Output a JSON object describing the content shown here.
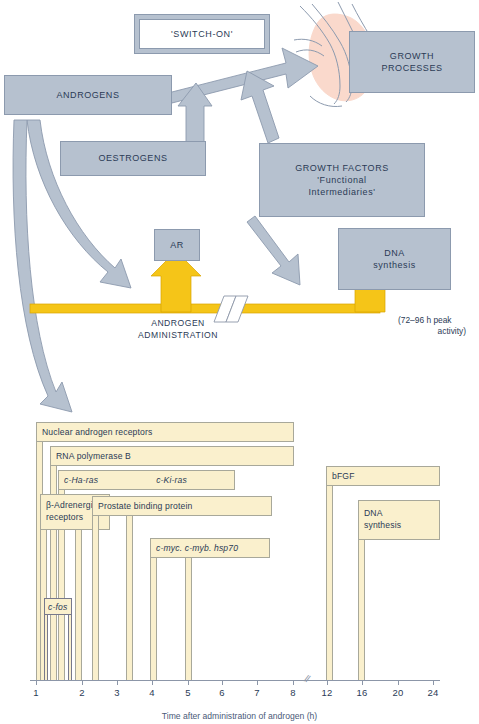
{
  "figure": {
    "flow": {
      "switch_on": "'SWITCH-ON'",
      "androgens": "ANDROGENS",
      "oestrogens": "OESTROGENS",
      "growth_processes": "GROWTH\nPROCESSES",
      "growth_processes_line1": "GROWTH",
      "growth_processes_line2": "PROCESSES",
      "growth_factors_line1": "GROWTH FACTORS",
      "growth_factors_line2": "'Functional",
      "growth_factors_line3": "Intermediaries'",
      "ar": "AR",
      "dna_line1": "DNA",
      "dna_line2": "synthesis",
      "androgen_administration_line1": "ANDROGEN",
      "androgen_administration_line2": "ADMINISTRATION",
      "peak_note_line1": "(72–96 h peak",
      "peak_note_line2": "activity)"
    },
    "colors": {
      "box_fill": "#b6c1cf",
      "box_stroke": "#8c9aae",
      "arrow_fill": "#b6c1cf",
      "yellow_arrow": "#f5c518",
      "band_fill": "#faf0cd",
      "band_stroke": "#a8a89a",
      "organ_fill": "#fad9cc",
      "text": "#2b3b56",
      "axis": "#8c96a8"
    }
  },
  "chart_data": {
    "type": "bar",
    "title": "",
    "xlabel": "Time after administration of androgen (h)",
    "ylabel": "",
    "xlim": [
      0.6,
      25
    ],
    "grid": false,
    "legend": false,
    "axis_ticks": [
      1,
      2,
      3,
      4,
      5,
      6,
      7,
      8,
      12,
      16,
      20,
      24
    ],
    "axis_break_between": [
      8,
      12
    ],
    "note": "Horizontal nested bands: each response begins at its onset time (left edge) and the band label sits above the stem that drops to the axis at the termination time.",
    "series": [
      {
        "name": "Nuclear androgen receptors",
        "onset_h": 1.0,
        "end_h": 11.6,
        "label": "Nuclear androgen receptors",
        "italic": false,
        "outline": "gray-yellow"
      },
      {
        "name": "RNA polymerase B",
        "onset_h": 1.3,
        "end_h": 11.6,
        "label": "RNA polymerase B",
        "italic": false,
        "outline": "gray-yellow"
      },
      {
        "name": "c-Ha-ras / c-Ki-ras",
        "onset_h": 1.45,
        "end_h": 9.2,
        "label": "c-Ha-ras",
        "label2": "c-Ki-ras",
        "italic": true,
        "outline": "gray-yellow"
      },
      {
        "name": "β-Adrenergic receptors",
        "onset_h": 1.1,
        "end_h": 2.05,
        "label": "β-Adrenergic\nreceptors",
        "label_line1": "β-Adrenergic",
        "label_line2": "receptors",
        "italic": false,
        "outline": "gray-yellow"
      },
      {
        "name": "Prostate binding protein",
        "onset_h": 2.4,
        "end_h": 3.55,
        "label": "Prostate binding protein",
        "italic": false,
        "outline": "gray-yellow"
      },
      {
        "name": "c-myc. c-myb. hsp70",
        "onset_h": 3.9,
        "end_h": 5.0,
        "label": "c-myc. c-myb. hsp70",
        "italic": true,
        "outline": "gray-yellow"
      },
      {
        "name": "c-fos",
        "onset_h": 1.15,
        "end_h": 1.45,
        "label": "c-fos",
        "italic": true,
        "outline": "gray"
      },
      {
        "name": "bFGF",
        "onset_h": 11.7,
        "end_h": 15.6,
        "label": "bFGF",
        "italic": false,
        "outline": "gray-yellow"
      },
      {
        "name": "DNA synthesis",
        "onset_h": 13.2,
        "end_h": 16.1,
        "label": "DNA\nsynthesis",
        "label_line1": "DNA",
        "label_line2": "synthesis",
        "italic": false,
        "outline": "gray-yellow"
      }
    ]
  }
}
